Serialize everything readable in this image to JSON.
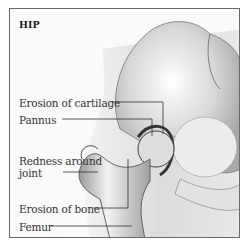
{
  "figure": {
    "title": "HIP",
    "labels": [
      {
        "id": "erosion-cartilage",
        "text": "Erosion of cartilage"
      },
      {
        "id": "pannus",
        "text": "Pannus"
      },
      {
        "id": "redness-line1",
        "text": "Redness around"
      },
      {
        "id": "redness-line2",
        "text": "joint"
      },
      {
        "id": "erosion-bone",
        "text": "Erosion of bone"
      },
      {
        "id": "femur",
        "text": "Femur"
      }
    ]
  }
}
